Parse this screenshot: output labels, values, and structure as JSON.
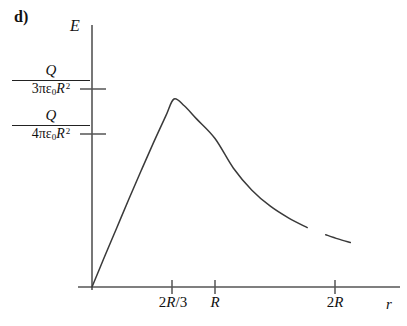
{
  "figure": {
    "part_label": "d)",
    "y_axis_label": "E",
    "x_axis_label": "r"
  },
  "chart_data": {
    "type": "line",
    "title": "",
    "xlabel": "r",
    "ylabel": "E",
    "grid": false,
    "legend": null,
    "x_ticks": [
      {
        "label": "2R/3",
        "label_parts": {
          "coef": "2",
          "sym": "R",
          "tail": "/3"
        },
        "value": 0.6667
      },
      {
        "label": "R",
        "label_parts": {
          "coef": "",
          "sym": "R",
          "tail": ""
        },
        "value": 1.0
      },
      {
        "label": "2R",
        "label_parts": {
          "coef": "2",
          "sym": "R",
          "tail": ""
        },
        "value": 2.0
      }
    ],
    "y_ticks": [
      {
        "label": "Q/(3πε₀R²)",
        "numerator": "Q",
        "denominator_coef": "3",
        "denominator_pi": "πε",
        "denominator_sub": "0",
        "denominator_sym": "R",
        "denominator_sup": "2",
        "value": 0.3333
      },
      {
        "label": "Q/(4πε₀R²)",
        "numerator": "Q",
        "denominator_coef": "4",
        "denominator_pi": "πε",
        "denominator_sub": "0",
        "denominator_sym": "R",
        "denominator_sup": "2",
        "value": 0.25
      }
    ],
    "xlim": [
      0,
      2.55
    ],
    "ylim": [
      0,
      0.42
    ],
    "series": [
      {
        "name": "E(r)",
        "description": "Electric field rising linearly inside the sphere to a peak at r = 2R/3, then falling as 1/r^2 outside",
        "color": "#333333",
        "x": [
          0.0,
          0.1,
          0.2,
          0.3,
          0.4,
          0.5,
          0.6,
          0.6667,
          0.75,
          0.85,
          1.0,
          1.15,
          1.3,
          1.45,
          1.6,
          1.75,
          1.9,
          2.0,
          2.1
        ],
        "y": [
          0.0,
          0.05,
          0.099,
          0.148,
          0.196,
          0.243,
          0.288,
          0.3165,
          0.305,
          0.283,
          0.25,
          0.2,
          0.163,
          0.136,
          0.116,
          0.1,
          0.088,
          0.081,
          0.075
        ]
      }
    ],
    "curve_break": {
      "present": true,
      "description": "small gap in the curve near r = 2R"
    }
  }
}
